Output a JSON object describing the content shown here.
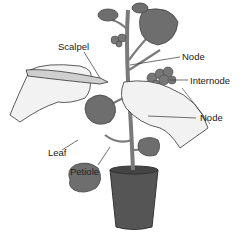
{
  "diagram": {
    "labels": {
      "scalpel": "Scalpel",
      "node_top": "Node",
      "internode": "Internode",
      "node_bottom": "Node",
      "leaf": "Leaf",
      "petiole": "Petiole"
    },
    "colors": {
      "leaf": "#6e6e6e",
      "leaf_dark": "#4a4a4a",
      "stem": "#7a7a7a",
      "pot": "#555555",
      "hand": "#f2f2f2",
      "outline": "#333333",
      "text": "#222222"
    }
  }
}
